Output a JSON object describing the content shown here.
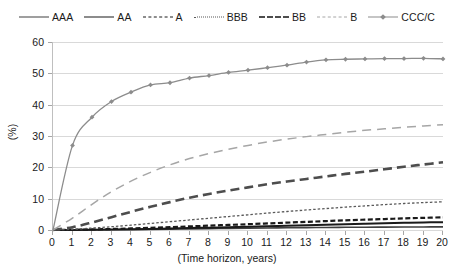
{
  "chart_data": {
    "type": "line",
    "title": "",
    "xlabel": "(Time horizon, years)",
    "ylabel": "(%)",
    "xlim": [
      0,
      20
    ],
    "ylim": [
      0,
      60
    ],
    "xticks": [
      0,
      1,
      2,
      3,
      4,
      5,
      6,
      7,
      8,
      9,
      10,
      11,
      12,
      13,
      14,
      15,
      16,
      17,
      18,
      19,
      20
    ],
    "yticks": [
      0,
      10,
      20,
      30,
      40,
      50,
      60
    ],
    "grid": true,
    "legend_position": "top",
    "x": [
      0,
      1,
      2,
      3,
      4,
      5,
      6,
      7,
      8,
      9,
      10,
      11,
      12,
      13,
      14,
      15,
      16,
      17,
      18,
      19,
      20
    ],
    "series": [
      {
        "name": "AAA",
        "style": "solid",
        "color": "#404040",
        "width": 1.6,
        "marker": "none",
        "values": [
          0,
          0,
          0.02,
          0.06,
          0.12,
          0.2,
          0.28,
          0.37,
          0.45,
          0.53,
          0.6,
          0.66,
          0.72,
          0.77,
          0.82,
          0.86,
          0.9,
          0.93,
          0.96,
          0.98,
          1.0
        ]
      },
      {
        "name": "AA",
        "style": "solid",
        "color": "#1a1a1a",
        "width": 2.0,
        "marker": "none",
        "values": [
          0,
          0.02,
          0.06,
          0.13,
          0.23,
          0.34,
          0.47,
          0.61,
          0.75,
          0.9,
          1.04,
          1.2,
          1.36,
          1.52,
          1.68,
          1.84,
          2.0,
          2.15,
          2.28,
          2.4,
          2.5
        ]
      },
      {
        "name": "A",
        "style": "dashed-short",
        "color": "#1a1a1a",
        "width": 2.2,
        "marker": "none",
        "values": [
          0,
          0.06,
          0.17,
          0.32,
          0.5,
          0.7,
          0.92,
          1.15,
          1.38,
          1.62,
          1.85,
          2.1,
          2.35,
          2.6,
          2.85,
          3.08,
          3.3,
          3.5,
          3.7,
          3.88,
          4.05
        ]
      },
      {
        "name": "BBB",
        "style": "dotted",
        "color": "#595959",
        "width": 1.3,
        "marker": "none",
        "values": [
          0,
          0.22,
          0.6,
          1.05,
          1.55,
          2.1,
          2.65,
          3.2,
          3.75,
          4.3,
          4.85,
          5.4,
          5.9,
          6.4,
          6.85,
          7.3,
          7.7,
          8.1,
          8.45,
          8.75,
          9.0
        ]
      },
      {
        "name": "BB",
        "style": "dashed-long",
        "color": "#4d4d4d",
        "width": 2.6,
        "marker": "none",
        "values": [
          0,
          0.9,
          2.4,
          4.1,
          5.8,
          7.4,
          8.9,
          10.3,
          11.5,
          12.6,
          13.6,
          14.6,
          15.5,
          16.3,
          17.1,
          17.9,
          18.6,
          19.4,
          20.2,
          20.9,
          21.6
        ]
      },
      {
        "name": "B",
        "style": "dashed-long-thin",
        "color": "#a6a6a6",
        "width": 1.5,
        "marker": "none",
        "values": [
          0,
          3.8,
          8.2,
          12.2,
          15.6,
          18.4,
          20.8,
          22.8,
          24.4,
          25.8,
          27.0,
          28.1,
          29.0,
          29.8,
          30.5,
          31.2,
          31.8,
          32.3,
          32.8,
          33.2,
          33.6
        ]
      },
      {
        "name": "CCC/C",
        "style": "solid-marker",
        "color": "#8c8c8c",
        "width": 1.3,
        "marker": "diamond",
        "values": [
          0,
          27.0,
          36.0,
          41.0,
          44.0,
          46.3,
          47.0,
          48.5,
          49.3,
          50.3,
          51.0,
          51.8,
          52.6,
          53.6,
          54.3,
          54.5,
          54.6,
          54.7,
          54.7,
          54.8,
          54.6
        ]
      }
    ]
  },
  "legend": {
    "items": [
      {
        "label": "AAA"
      },
      {
        "label": "AA"
      },
      {
        "label": "A"
      },
      {
        "label": "BBB"
      },
      {
        "label": "BB"
      },
      {
        "label": "B"
      },
      {
        "label": "CCC/C"
      }
    ]
  },
  "axes": {
    "x_title": "(Time horizon, years)",
    "y_title": "(%)",
    "x_tick_labels": [
      "0",
      "1",
      "2",
      "3",
      "4",
      "5",
      "6",
      "7",
      "8",
      "9",
      "10",
      "11",
      "12",
      "13",
      "14",
      "15",
      "16",
      "17",
      "18",
      "19",
      "20"
    ],
    "y_tick_labels": [
      "0",
      "10",
      "20",
      "30",
      "40",
      "50",
      "60"
    ]
  },
  "colors": {
    "grid": "#d9d9d9",
    "axis": "#808080",
    "text": "#1a1a1a",
    "background": "#ffffff"
  }
}
